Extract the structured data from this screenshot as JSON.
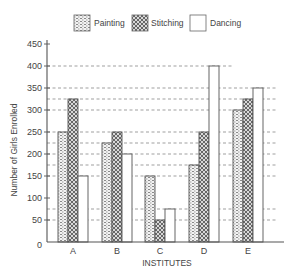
{
  "chart_data": {
    "type": "bar",
    "title": "",
    "xlabel": "INSTITUTES",
    "ylabel": "Number of Girls Enrolled",
    "categories": [
      "A",
      "B",
      "C",
      "D",
      "E"
    ],
    "series": [
      {
        "name": "Painting",
        "pattern": "dotted",
        "values": [
          250,
          225,
          150,
          175,
          300
        ]
      },
      {
        "name": "Stitching",
        "pattern": "crosshatch",
        "values": [
          325,
          250,
          50,
          250,
          325
        ]
      },
      {
        "name": "Dancing",
        "pattern": "none",
        "values": [
          150,
          200,
          75,
          400,
          350
        ]
      }
    ],
    "ylim": [
      0,
      450
    ],
    "yticks": [
      0,
      50,
      100,
      150,
      200,
      250,
      300,
      350,
      400,
      450
    ],
    "grid": "dashed reference lines at bar-top values",
    "reference_lines": [
      50,
      75,
      150,
      175,
      200,
      225,
      250,
      300,
      325,
      350,
      400
    ],
    "legend_position": "top"
  },
  "colors": {
    "axis": "#555555",
    "bar_outline": "#555555",
    "grid": "#777777",
    "text": "#444444"
  }
}
